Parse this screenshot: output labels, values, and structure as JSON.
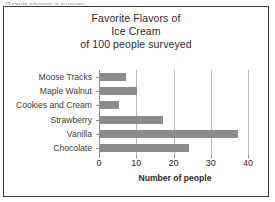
{
  "scan_artifact": {
    "text": "Graph shows a survey"
  },
  "chart_data": {
    "type": "bar",
    "orientation": "horizontal",
    "title": "Favorite Flavors of Ice Cream of 100 people surveyed",
    "title_lines": [
      "Favorite Flavors of",
      "Ice Cream",
      "of 100 people surveyed"
    ],
    "categories": [
      "Moose Tracks",
      "Maple Walnut",
      "Cookies and Cream",
      "Strawberry",
      "Vanilla",
      "Chocolate"
    ],
    "values": [
      7,
      10,
      5,
      17,
      37,
      24
    ],
    "xlabel": "Number of people",
    "ylabel": "",
    "xlim": [
      0,
      40
    ],
    "xticks": [
      0,
      10,
      20,
      30,
      40
    ],
    "xtick_labels": [
      "0",
      "10",
      "20",
      "30",
      "40"
    ],
    "grid": "vertical",
    "legend": "none",
    "bar_color": "#8c8c8c",
    "gridline_color": "#b9b9b9",
    "axis_color": "#8f8f8f",
    "frame_color": "#3a3a3a",
    "text_color": "#2b2b2b"
  }
}
